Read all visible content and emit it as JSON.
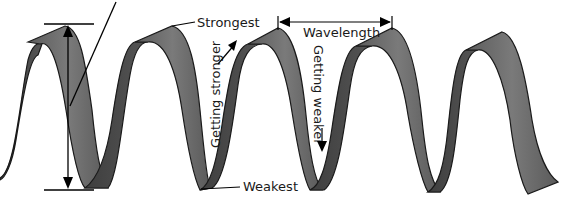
{
  "diagram": {
    "labels": {
      "strongest": "Strongest",
      "weakest": "Weakest",
      "wavelength": "Wavelength",
      "getting_stronger": "Getting stronger",
      "getting_weaker": "Getting weaker"
    },
    "colors": {
      "ribbon_front": "#6e6e6e",
      "ribbon_back": "#4a4a4a",
      "outline": "#1a1a1a",
      "line": "#000000"
    }
  }
}
